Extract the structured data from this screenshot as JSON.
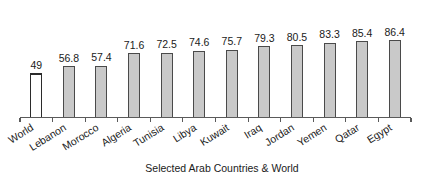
{
  "chart_data": {
    "type": "bar",
    "title": "",
    "subtitle": "",
    "xlabel": "Selected Arab Countries & World",
    "ylabel": "",
    "ylim": [
      0,
      95
    ],
    "grid": false,
    "legend": "none",
    "axis": {
      "y_axis_visible": false,
      "x_axis_visible": true,
      "tick_labels_rotated": true,
      "tick_label_rotation_deg": -32
    },
    "categories": [
      "World",
      "Lebanon",
      "Morocco",
      "Algeria",
      "Tunisia",
      "Libya",
      "Kuwait",
      "Iraq",
      "Jordan",
      "Yemen",
      "Qatar",
      "Egypt"
    ],
    "values": [
      49,
      56.8,
      57.4,
      71.6,
      72.5,
      74.6,
      75.7,
      79.3,
      80.5,
      83.3,
      85.4,
      86.4
    ],
    "value_labels": [
      "49",
      "56.8",
      "57.4",
      "71.6",
      "72.5",
      "74.6",
      "75.7",
      "79.3",
      "80.5",
      "83.3",
      "85.4",
      "86.4"
    ],
    "bar_styles": [
      "highlight",
      "normal",
      "normal",
      "normal",
      "normal",
      "normal",
      "normal",
      "normal",
      "normal",
      "normal",
      "normal",
      "normal"
    ]
  },
  "colors": {
    "bar_fill": "#c9c9c9",
    "bar_stroke": "#4a4a4a",
    "highlight_fill": "#ffffff",
    "highlight_stroke": "#2b2b2b",
    "axis": "#5a5a5a",
    "text": "#1a1a1a",
    "background": "#ffffff"
  },
  "axis_title": {
    "text": "Selected Arab Countries & World"
  }
}
